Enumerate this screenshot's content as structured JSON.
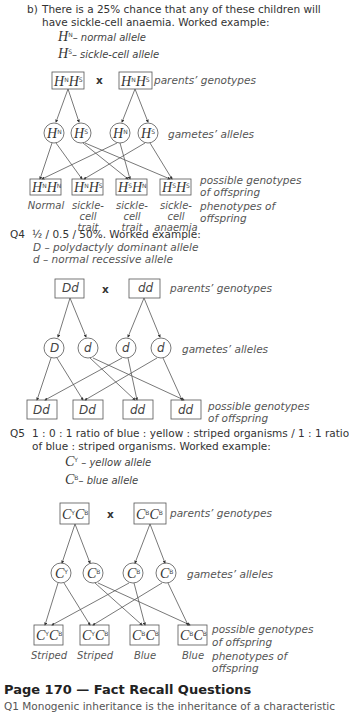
{
  "part_b": {
    "marker": "b)",
    "line1": "There is a 25% chance that any of these children will",
    "line2": "have sickle-cell anaemia.  Worked example:",
    "key": [
      {
        "symbol": "H",
        "sup": "N",
        "text": "– normal allele"
      },
      {
        "symbol": "H",
        "sup": "S",
        "text": "– sickle-cell allele"
      }
    ]
  },
  "labels": {
    "parents": "parents’ genotypes",
    "gametes": "gametes’ alleles",
    "offspring1": "possible genotypes",
    "offspring2": "of offspring",
    "pheno1": "phenotypes of",
    "pheno2": "offspring",
    "cross": "x"
  },
  "diagram1": {
    "parents": [
      {
        "a": "H",
        "as": "N",
        "b": "H",
        "bs": "S"
      },
      {
        "a": "H",
        "as": "N",
        "b": "H",
        "bs": "S"
      }
    ],
    "gametes": [
      {
        "s": "H",
        "sup": "N"
      },
      {
        "s": "H",
        "sup": "S"
      },
      {
        "s": "H",
        "sup": "N"
      },
      {
        "s": "H",
        "sup": "S"
      }
    ],
    "offspring": [
      {
        "a": "H",
        "as": "N",
        "b": "H",
        "bs": "N"
      },
      {
        "a": "H",
        "as": "N",
        "b": "H",
        "bs": "S"
      },
      {
        "a": "H",
        "as": "S",
        "b": "H",
        "bs": "N"
      },
      {
        "a": "H",
        "as": "S",
        "b": "H",
        "bs": "S"
      }
    ],
    "phenotypes": [
      [
        "Normal",
        ""
      ],
      [
        "sickle-cell",
        "trait"
      ],
      [
        "sickle-cell",
        "trait"
      ],
      [
        "sickle-cell",
        "anaemia"
      ]
    ]
  },
  "q4": {
    "marker": "Q4",
    "line1": "½ / 0.5 / 50%.  Worked example:",
    "key": [
      "D  –  polydactyly dominant allele",
      "d  –  normal recessive allele"
    ],
    "parents": [
      "Dd",
      "dd"
    ],
    "gametes": [
      "D",
      "d",
      "d",
      "d"
    ],
    "offspring": [
      "Dd",
      "Dd",
      "dd",
      "dd"
    ]
  },
  "q5": {
    "marker": "Q5",
    "line1": "1 : 0 : 1 ratio of blue : yellow : striped organisms / 1 : 1 ratio",
    "line2": "of blue : striped organisms.  Worked example:",
    "key": [
      {
        "symbol": "C",
        "sup": "Y",
        "text": "– yellow allele"
      },
      {
        "symbol": "C",
        "sup": "B",
        "text": "– blue allele"
      }
    ],
    "parents": [
      {
        "a": "C",
        "as": "Y",
        "b": "C",
        "bs": "B"
      },
      {
        "a": "C",
        "as": "B",
        "b": "C",
        "bs": "B"
      }
    ],
    "gametes": [
      {
        "s": "C",
        "sup": "Y"
      },
      {
        "s": "C",
        "sup": "B"
      },
      {
        "s": "C",
        "sup": "B"
      },
      {
        "s": "C",
        "sup": "B"
      }
    ],
    "offspring": [
      {
        "a": "C",
        "as": "Y",
        "b": "C",
        "bs": "B"
      },
      {
        "a": "C",
        "as": "Y",
        "b": "C",
        "bs": "B"
      },
      {
        "a": "C",
        "as": "B",
        "b": "C",
        "bs": "B"
      },
      {
        "a": "C",
        "as": "B",
        "b": "C",
        "bs": "B"
      }
    ],
    "phenotypes": [
      "Striped",
      "Striped",
      "Blue",
      "Blue"
    ]
  },
  "footer": {
    "heading": "Page 170 — Fact Recall Questions",
    "cut_line": "Q1   Monogenic inheritance is the inheritance of a characteristic"
  }
}
